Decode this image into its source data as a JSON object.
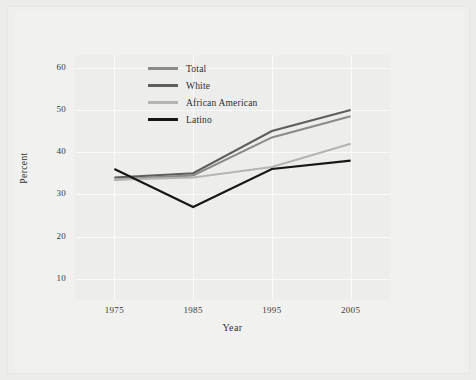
{
  "chart_data": {
    "type": "line",
    "title": "",
    "xlabel": "Year",
    "ylabel": "Percent",
    "x": [
      1975,
      1985,
      1995,
      2005
    ],
    "categories": [
      "1975",
      "1985",
      "1995",
      "2005"
    ],
    "xlim": [
      1970,
      2010
    ],
    "ylim": [
      5,
      63
    ],
    "xticks": [
      "1975",
      "1985",
      "1995",
      "2005"
    ],
    "yticks": [
      "10",
      "20",
      "30",
      "40",
      "50",
      "60"
    ],
    "ytick_values": [
      10,
      20,
      30,
      40,
      50,
      60
    ],
    "grid": true,
    "legend_position": "upper-left-inside",
    "series": [
      {
        "name": "Total",
        "color": "#8a8a88",
        "values": [
          33.5,
          34.5,
          43.5,
          48.5
        ]
      },
      {
        "name": "White",
        "color": "#5e5e5c",
        "values": [
          34.0,
          35.0,
          45.0,
          50.0
        ]
      },
      {
        "name": "African American",
        "color": "#b4b4b2",
        "values": [
          33.5,
          34.0,
          36.5,
          42.0
        ]
      },
      {
        "name": "Latino",
        "color": "#161614",
        "values": [
          36.0,
          27.0,
          36.0,
          38.0
        ]
      }
    ]
  },
  "legend": {
    "items": [
      {
        "label": "Total",
        "color": "#8a8a88"
      },
      {
        "label": "White",
        "color": "#5e5e5c"
      },
      {
        "label": "African American",
        "color": "#b4b4b2"
      },
      {
        "label": "Latino",
        "color": "#161614"
      }
    ]
  },
  "colors": {
    "page_background": "#ececeb",
    "paper": "#f1f1f0",
    "plot_background": "#ededec",
    "gridline": "#fafafa",
    "text": "#33332f"
  }
}
